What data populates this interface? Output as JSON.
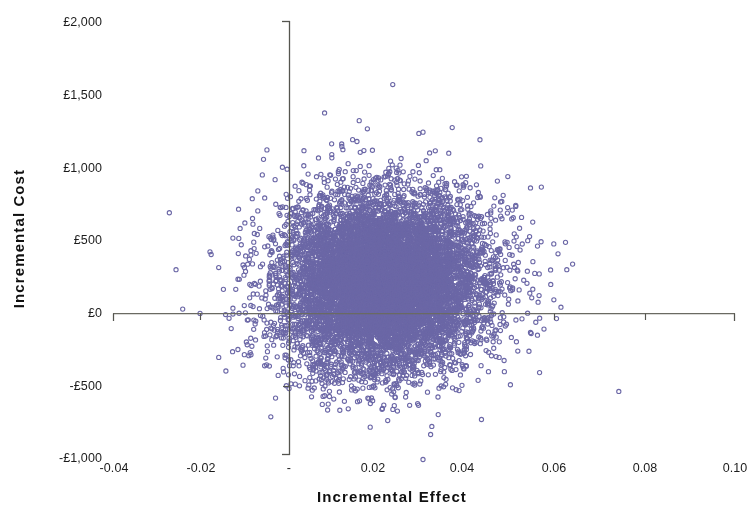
{
  "chart_data": {
    "type": "scatter",
    "title": "",
    "subtitle": "",
    "xlabel": "Incremental Effect",
    "ylabel": "Incremental Cost",
    "grid": false,
    "legend": null,
    "legend_position": "none",
    "xlim": [
      -0.04,
      0.1
    ],
    "ylim": [
      -1000,
      2000
    ],
    "xticks": [
      -0.04,
      -0.02,
      0,
      0.02,
      0.04,
      0.06,
      0.08,
      0.1
    ],
    "xticklabels": [
      "-0.04",
      "-0.02",
      "-",
      "0.02",
      "0.04",
      "0.06",
      "0.08",
      "0.10"
    ],
    "yticks": [
      2000,
      1500,
      1000,
      500,
      0,
      -500,
      -1000
    ],
    "yticklabels": [
      "£2,000",
      "£1,500",
      "£1,000",
      "£500",
      "£0",
      "-£500",
      "-£1,000"
    ],
    "currency_symbol": "£",
    "axis_origin_x": 0,
    "axis_origin_y": 0,
    "marker": {
      "shape": "open-circle",
      "color": "#6b67a6",
      "fill": "none",
      "size_px": 4.2,
      "stroke_width_px": 1.1
    },
    "series": [
      {
        "name": "Bootstrap replicates",
        "n_points": 10000,
        "distribution": "bivariate-normal",
        "mean_x": 0.0212,
        "mean_y": 215,
        "sd_x": 0.0112,
        "sd_y": 293,
        "correlation": 0.06,
        "x_observed_range": [
          -0.027,
          0.074
        ],
        "y_observed_range": [
          -1000,
          1570
        ],
        "seed": 20240517
      }
    ],
    "outliers": [
      {
        "x": 0.0232,
        "y": 1568,
        "note": "topmost point"
      },
      {
        "x": 0.0175,
        "y": 1265
      },
      {
        "x": 0.03,
        "y": 1242
      },
      {
        "x": 0.0428,
        "y": 1190
      },
      {
        "x": 0.012,
        "y": 1122
      },
      {
        "x": 0.0523,
        "y": 476
      },
      {
        "x": 0.061,
        "y": 43
      },
      {
        "x": 0.06,
        "y": -35
      },
      {
        "x": 0.074,
        "y": -534
      },
      {
        "x": 0.03,
        "y": -1000
      },
      {
        "x": -0.027,
        "y": 690
      },
      {
        "x": -0.0255,
        "y": 300
      },
      {
        "x": -0.024,
        "y": 30
      }
    ],
    "quadrant_note": "Cost-effectiveness plane; vertical axis at incremental effect = 0, horizontal axis at incremental cost = £0."
  },
  "axes": {
    "y_axis_title": "Incremental Cost",
    "x_axis_title": "Incremental Effect",
    "y_tick_labels": [
      "£2,000",
      "£1,500",
      "£1,000",
      "£500",
      "£0",
      "-£500",
      "-£1,000"
    ],
    "x_tick_labels": [
      "-0.04",
      "-0.02",
      "-",
      "0.02",
      "0.04",
      "0.06",
      "0.08",
      "0.10"
    ]
  },
  "colors": {
    "marker": "#6b67a6",
    "axis_line": "#55554f",
    "text": "#1c1c1c",
    "background": "#ffffff"
  }
}
